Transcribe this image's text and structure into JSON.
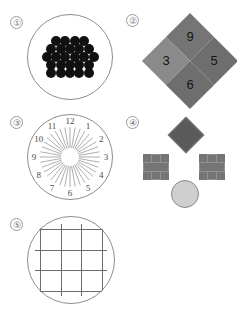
{
  "page": {
    "background_color": "#ffffff",
    "width": 237,
    "height": 310
  },
  "panels": [
    {
      "marker": "①",
      "name": "dot-cluster",
      "shape": "circle",
      "outline_color": "#8d8d8d",
      "dot_color": "#111111",
      "dot_count": 25,
      "dot_radius": 5,
      "arrangement": "hexagonal-cluster",
      "rows": [
        4,
        5,
        6,
        5,
        5
      ]
    },
    {
      "marker": "②",
      "name": "numbered-diamonds",
      "shape": "diamond",
      "items": [
        {
          "label": "9",
          "position": "top",
          "fill": "#757575"
        },
        {
          "label": "3",
          "position": "left",
          "fill": "#8a8a8a"
        },
        {
          "label": "5",
          "position": "right",
          "fill": "#6e6e6e"
        },
        {
          "label": "6",
          "position": "bottom",
          "fill": "#6e6e6e"
        }
      ]
    },
    {
      "marker": "③",
      "name": "clock-sunburst",
      "shape": "circle",
      "outline_color": "#8d8d8d",
      "ray_color": "#8b8b8b",
      "ray_count": 36,
      "hub_radius": 9,
      "hour_labels": [
        "12",
        "1",
        "2",
        "3",
        "4",
        "5",
        "6",
        "7",
        "8",
        "9",
        "10",
        "11"
      ]
    },
    {
      "marker": "④",
      "name": "shape-set",
      "items": [
        {
          "shape": "diamond",
          "position": "top",
          "fill": "#5a5a5a",
          "stroke": "#7d7d7d"
        },
        {
          "shape": "cross",
          "position": "left",
          "fill": "#757575",
          "stroke": "#909090"
        },
        {
          "shape": "cross",
          "position": "right",
          "fill": "#757575",
          "stroke": "#909090"
        },
        {
          "shape": "circle",
          "position": "bottom",
          "fill": "#cfcfcf",
          "stroke": "#888888"
        }
      ]
    },
    {
      "marker": "⑤",
      "name": "grid-in-circle",
      "shape": "circle",
      "outline_color": "#8d8d8d",
      "line_color": "#6d6d6d",
      "vertical_lines": 4,
      "horizontal_lines": 4
    }
  ]
}
